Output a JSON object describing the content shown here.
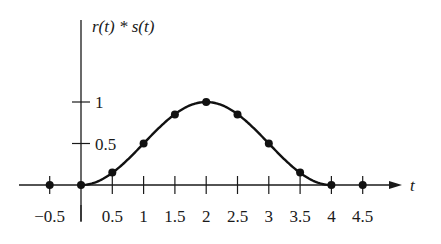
{
  "chart_data": {
    "type": "line",
    "title": "",
    "ylabel": "r(t) * s(t)",
    "xlabel": "t",
    "x": [
      -0.5,
      0,
      0.5,
      1,
      1.5,
      2,
      2.5,
      3,
      3.5,
      4,
      4.5
    ],
    "series": [
      {
        "name": "r(t) * s(t)",
        "values": [
          0,
          0,
          0.15,
          0.5,
          0.85,
          1,
          0.85,
          0.5,
          0.15,
          0,
          0
        ],
        "markers": true
      }
    ],
    "xticks": [
      "-0.5",
      "0.5",
      "1",
      "1.5",
      "2",
      "2.5",
      "3",
      "3.5",
      "4",
      "4.5"
    ],
    "yticks": [
      "0.5",
      "1"
    ],
    "xlim": [
      -1,
      5.3
    ],
    "ylim": [
      0,
      1.3
    ],
    "grid": false,
    "legend": "none"
  },
  "labels": {
    "y_axis": "r(t) * s(t)",
    "x_axis": "t",
    "xtick_values": [
      "−0.5",
      "0.5",
      "1",
      "1.5",
      "2",
      "2.5",
      "3",
      "3.5",
      "4",
      "4.5"
    ],
    "ytick_values": [
      "0.5",
      "1"
    ]
  }
}
